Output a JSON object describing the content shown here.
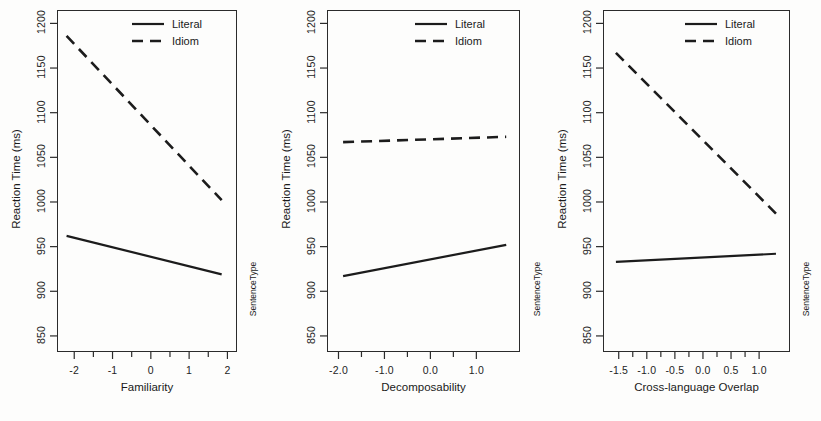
{
  "figure": {
    "background_color": "#fdfdfc",
    "line_color": "#1c1c1c",
    "axis_color": "#2b2b2b",
    "strip_label": "SentenceType",
    "ylabel": "Reaction Time (ms)",
    "legend_entries": [
      {
        "label": "Literal",
        "style": "solid"
      },
      {
        "label": "Idiom",
        "style": "dashed"
      }
    ]
  },
  "chart_data": [
    {
      "type": "line",
      "panel": 1,
      "title": "",
      "xlabel": "Familiarity",
      "ylabel": "Reaction Time (ms)",
      "xlim": [
        -2.45,
        2.25
      ],
      "ylim": [
        832,
        1215
      ],
      "xticks": [
        -2,
        -1,
        0,
        1,
        2
      ],
      "xtick_labels": [
        "-2",
        "-1",
        "0",
        "1",
        "2"
      ],
      "yticks": [
        850,
        900,
        950,
        1000,
        1050,
        1100,
        1150,
        1200
      ],
      "ytick_labels": [
        "850",
        "900",
        "950",
        "1000",
        "1050",
        "1100",
        "1150",
        "1200"
      ],
      "grid": false,
      "legend_position": "top-right",
      "series": [
        {
          "name": "Literal",
          "style": "solid",
          "x": [
            -2.2,
            1.85
          ],
          "y": [
            962,
            919
          ]
        },
        {
          "name": "Idiom",
          "style": "dashed",
          "x": [
            -2.2,
            1.85
          ],
          "y": [
            1186,
            1002
          ]
        }
      ]
    },
    {
      "type": "line",
      "panel": 2,
      "title": "",
      "xlabel": "Decomposability",
      "ylabel": "Reaction Time (ms)",
      "xlim": [
        -2.25,
        1.95
      ],
      "ylim": [
        832,
        1215
      ],
      "xticks": [
        -2.0,
        -1.0,
        0.0,
        1.0
      ],
      "xtick_labels": [
        "-2.0",
        "-1.0",
        "0.0",
        "1.0"
      ],
      "yticks": [
        850,
        900,
        950,
        1000,
        1050,
        1100,
        1150,
        1200
      ],
      "ytick_labels": [
        "850",
        "900",
        "950",
        "1000",
        "1050",
        "1100",
        "1150",
        "1200"
      ],
      "grid": false,
      "legend_position": "top-right",
      "series": [
        {
          "name": "Literal",
          "style": "solid",
          "x": [
            -1.9,
            1.65
          ],
          "y": [
            917,
            952
          ]
        },
        {
          "name": "Idiom",
          "style": "dashed",
          "x": [
            -1.9,
            1.65
          ],
          "y": [
            1067,
            1073
          ]
        }
      ]
    },
    {
      "type": "line",
      "panel": 3,
      "title": "",
      "xlabel": "Cross-language Overlap",
      "ylabel": "Reaction Time (ms)",
      "xlim": [
        -1.78,
        1.55
      ],
      "ylim": [
        832,
        1215
      ],
      "xticks": [
        -1.5,
        -1.0,
        -0.5,
        0.0,
        0.5,
        1.0
      ],
      "xtick_labels": [
        "-1.5",
        "-1.0",
        "-0.5",
        "0.0",
        "0.5",
        "1.0"
      ],
      "yticks": [
        850,
        900,
        950,
        1000,
        1050,
        1100,
        1150,
        1200
      ],
      "ytick_labels": [
        "850",
        "900",
        "950",
        "1000",
        "1050",
        "1100",
        "1150",
        "1200"
      ],
      "grid": false,
      "legend_position": "top-right",
      "series": [
        {
          "name": "Literal",
          "style": "solid",
          "x": [
            -1.55,
            1.3
          ],
          "y": [
            933,
            942
          ]
        },
        {
          "name": "Idiom",
          "style": "dashed",
          "x": [
            -1.55,
            1.3
          ],
          "y": [
            1167,
            987
          ]
        }
      ]
    }
  ]
}
